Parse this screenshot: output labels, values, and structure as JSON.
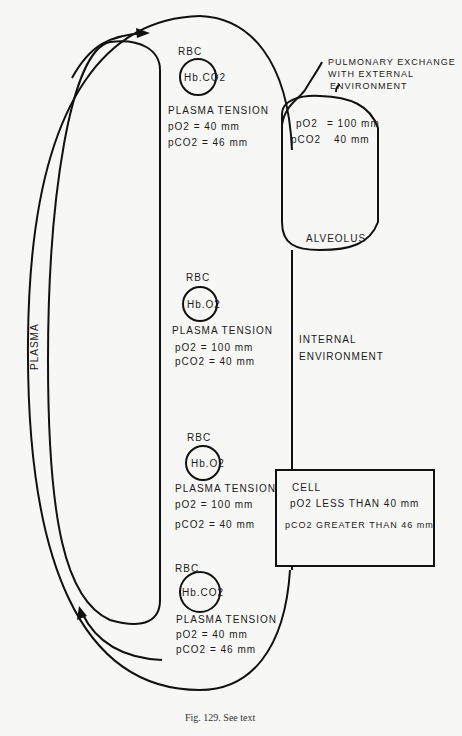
{
  "diagram": {
    "plasma_label": "PLASMA",
    "pulmonary": {
      "label_line1": "PULMONARY EXCHANGE",
      "label_line2": "WITH EXTERNAL",
      "label_line3": "ENVIRONMENT"
    },
    "alveolus": {
      "name": "ALVEOLUS",
      "po2_label": "pO2",
      "po2_value": "= 100 mm",
      "pco2_label": "pCO2",
      "pco2_value": "40 mm"
    },
    "internal_environment": {
      "line1": "INTERNAL",
      "line2": "ENVIRONMENT"
    },
    "rbc_stations": [
      {
        "rbc_label": "RBC",
        "hb": "Hb.CO2",
        "tension_label": "PLASMA TENSION",
        "po2": "pO2 = 40 mm",
        "pco2": "pCO2 = 46 mm"
      },
      {
        "rbc_label": "RBC",
        "hb": "Hb.O2",
        "tension_label": "PLASMA TENSION",
        "po2": "pO2 = 100 mm",
        "pco2": "pCO2 = 40 mm"
      },
      {
        "rbc_label": "RBC",
        "hb": "Hb.O2",
        "tension_label": "PLASMA TENSION",
        "po2": "pO2 = 100 mm",
        "pco2": "pCO2 = 40 mm"
      },
      {
        "rbc_label": "RBC",
        "hb": "Hb.CO2",
        "tension_label": "PLASMA TENSION",
        "po2": "pO2 = 40 mm",
        "pco2": "pCO2 = 46 mm"
      }
    ],
    "cell": {
      "name": "CELL",
      "po2": "pO2 LESS THAN 40 mm",
      "pco2": "pCO2 GREATER THAN 46 mm"
    },
    "caption": "Fig. 129. See text"
  }
}
